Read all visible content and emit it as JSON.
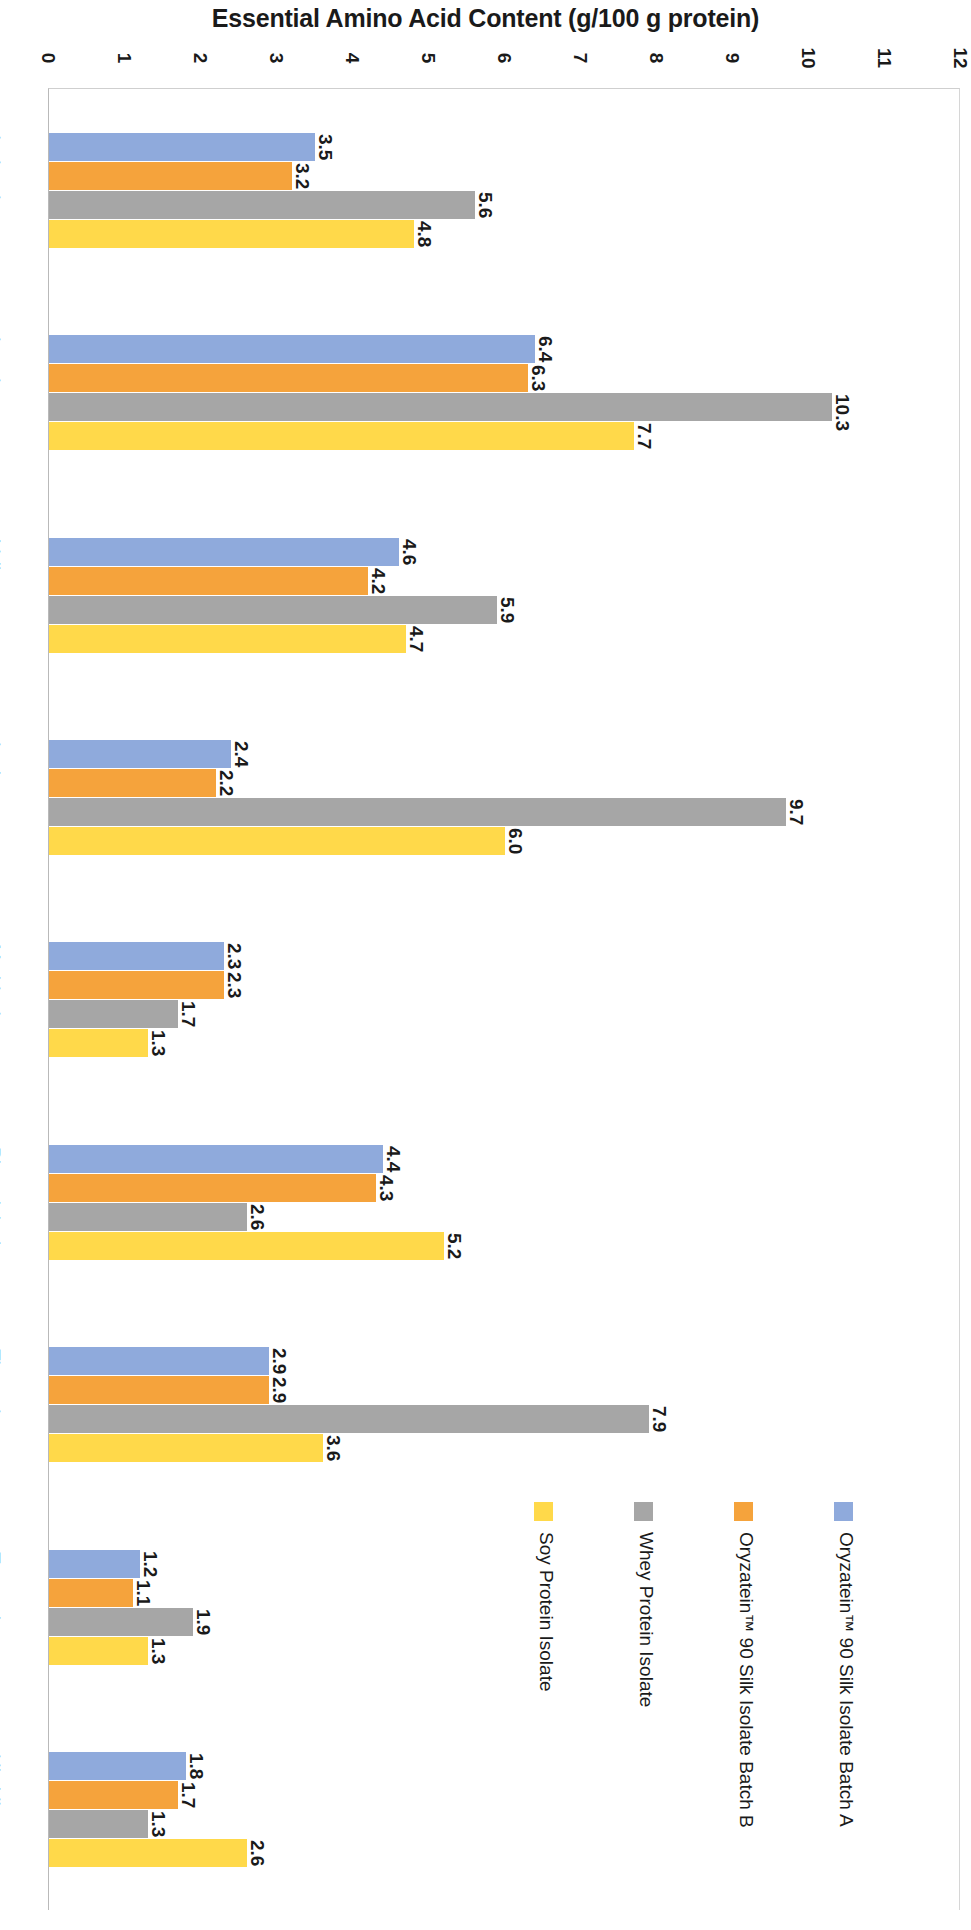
{
  "chart_data": {
    "type": "bar",
    "orientation": "horizontal",
    "title": "Essential Amino Acid Content (g/100 g protein)",
    "xlabel": "",
    "ylabel": "",
    "xlim": [
      0,
      12
    ],
    "grid": false,
    "legend_position": "bottom-right",
    "axis_ticks": [
      "0",
      "1",
      "2",
      "3",
      "4",
      "5",
      "6",
      "7",
      "8",
      "9",
      "10",
      "11",
      "12"
    ],
    "categories": [
      "Isoleucine",
      "Leucine",
      "Valine",
      "Lysine",
      "Methionine",
      "Phenylalanine",
      "Threonine",
      "Tryptophan",
      "Histidine"
    ],
    "series": [
      {
        "name": "Oryzatein™ 90 Silk Isolate Batch A",
        "color": "#8FAADC",
        "values": [
          3.5,
          6.4,
          4.6,
          2.4,
          2.3,
          4.4,
          2.9,
          1.2,
          1.8
        ],
        "labels": [
          "3.5",
          "6.4",
          "4.6",
          "2.4",
          "2.3",
          "4.4",
          "2.9",
          "1.2",
          "1.8"
        ]
      },
      {
        "name": "Oryzatein™ 90 Silk Isolate Batch B",
        "color": "#F5A33C",
        "values": [
          3.2,
          6.3,
          4.2,
          2.2,
          2.3,
          4.3,
          2.9,
          1.1,
          1.7
        ],
        "labels": [
          "3.2",
          "6.3",
          "4.2",
          "2.2",
          "2.3",
          "4.3",
          "2.9",
          "1.1",
          "1.7"
        ]
      },
      {
        "name": "Whey Protein Isolate",
        "color": "#A6A6A6",
        "values": [
          5.6,
          10.3,
          5.9,
          9.7,
          1.7,
          2.6,
          7.9,
          1.9,
          1.3
        ],
        "labels": [
          "5.6",
          "10.3",
          "5.9",
          "9.7",
          "1.7",
          "2.6",
          "7.9",
          "1.9",
          "1.3"
        ]
      },
      {
        "name": "Soy Protein Isolate",
        "color": "#FFD94A",
        "values": [
          4.8,
          7.7,
          4.7,
          6.0,
          1.3,
          5.2,
          3.6,
          1.3,
          2.6
        ],
        "labels": [
          "4.8",
          "7.7",
          "4.7",
          "6.0",
          "1.3",
          "5.2",
          "3.6",
          "1.3",
          "2.6"
        ]
      }
    ]
  }
}
